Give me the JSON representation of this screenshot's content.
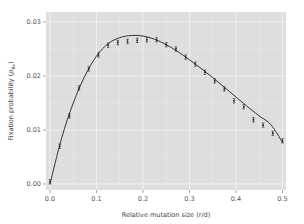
{
  "chart_data": {
    "type": "scatter",
    "title": "",
    "xlabel": "Relative mutation size (r/d)",
    "ylabel": "Fixation probability (p_fix)",
    "ylabel_main": "Fixation probability (",
    "ylabel_var": "p",
    "ylabel_sub": "fix",
    "ylabel_close": ")",
    "xlim": [
      0.0,
      0.5
    ],
    "ylim": [
      0.0,
      0.03
    ],
    "x_ticks": [
      "0.0",
      "0.1",
      "0.2",
      "0.3",
      "0.4",
      "0.5"
    ],
    "y_ticks": [
      "0.00",
      "0.01",
      "0.02",
      "0.03"
    ],
    "grid": true,
    "legend": null,
    "series": [
      {
        "name": "simulation",
        "style": "points with error bars",
        "x": [
          0.0,
          0.0208,
          0.0417,
          0.0625,
          0.0833,
          0.1042,
          0.125,
          0.1458,
          0.1667,
          0.1875,
          0.2083,
          0.2292,
          0.25,
          0.2708,
          0.2917,
          0.3125,
          0.3333,
          0.3542,
          0.375,
          0.3958,
          0.4167,
          0.4375,
          0.4583,
          0.4792,
          0.5
        ],
        "values": [
          0.0004,
          0.007,
          0.0126,
          0.0178,
          0.0213,
          0.0239,
          0.0257,
          0.0262,
          0.0264,
          0.0266,
          0.0267,
          0.0267,
          0.0258,
          0.025,
          0.0235,
          0.0222,
          0.0207,
          0.0191,
          0.0176,
          0.0154,
          0.0143,
          0.0119,
          0.0109,
          0.0094,
          0.008
        ],
        "error": 0.0004
      },
      {
        "name": "theory",
        "style": "line",
        "x": [
          0.0,
          0.025,
          0.05,
          0.075,
          0.1,
          0.125,
          0.15,
          0.175,
          0.2,
          0.225,
          0.25,
          0.275,
          0.3,
          0.325,
          0.35,
          0.375,
          0.4,
          0.425,
          0.45,
          0.475,
          0.5
        ],
        "values": [
          0.0,
          0.0085,
          0.015,
          0.02,
          0.0237,
          0.026,
          0.0271,
          0.0275,
          0.0274,
          0.0268,
          0.0258,
          0.0245,
          0.023,
          0.0214,
          0.0197,
          0.0179,
          0.0161,
          0.0143,
          0.0126,
          0.011,
          0.0077
        ]
      }
    ],
    "colors": {
      "panel_background": "#dedede",
      "grid": "#f4f4f4",
      "line": "#222222",
      "points": "#222222"
    }
  }
}
